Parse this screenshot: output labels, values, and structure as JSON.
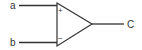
{
  "diagram": {
    "type": "op-amp comparator",
    "inputs": [
      {
        "label": "a",
        "polarity": "+",
        "polarity_symbol": "+"
      },
      {
        "label": "b",
        "polarity": "-",
        "polarity_symbol": "−"
      }
    ],
    "output": {
      "label": "C"
    },
    "colors": {
      "stroke": "#333333",
      "background": "#ffffff"
    }
  }
}
